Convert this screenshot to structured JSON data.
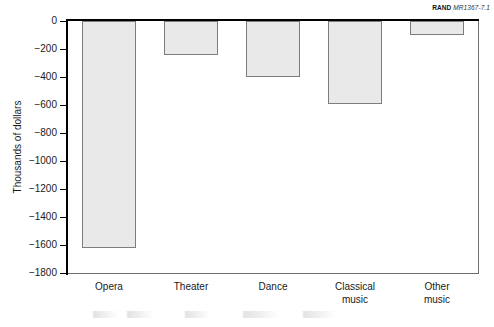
{
  "figure": {
    "brand": "RAND",
    "code": "MR1367-7.1"
  },
  "chart_data": {
    "type": "bar",
    "title": "",
    "xlabel": "",
    "ylabel": "Thousands of dollars",
    "categories": [
      "Opera",
      "Theater",
      "Dance",
      "Classical\nmusic",
      "Other\nmusic"
    ],
    "values": [
      -1620,
      -240,
      -400,
      -590,
      -100
    ],
    "ylim": [
      -1800,
      0
    ],
    "ytick_labels": [
      "0",
      "−200",
      "−400",
      "−600",
      "−800",
      "−1000",
      "−1200",
      "−1400",
      "−1600",
      "−1800"
    ],
    "ytick_values": [
      0,
      -200,
      -400,
      -600,
      -800,
      -1000,
      -1200,
      -1400,
      -1600,
      -1800
    ],
    "grid": false,
    "legend": null,
    "bar_fill_color": "#e9e9e9",
    "bar_edge_color": "#7d7d7d",
    "axis_color": "#000000"
  }
}
